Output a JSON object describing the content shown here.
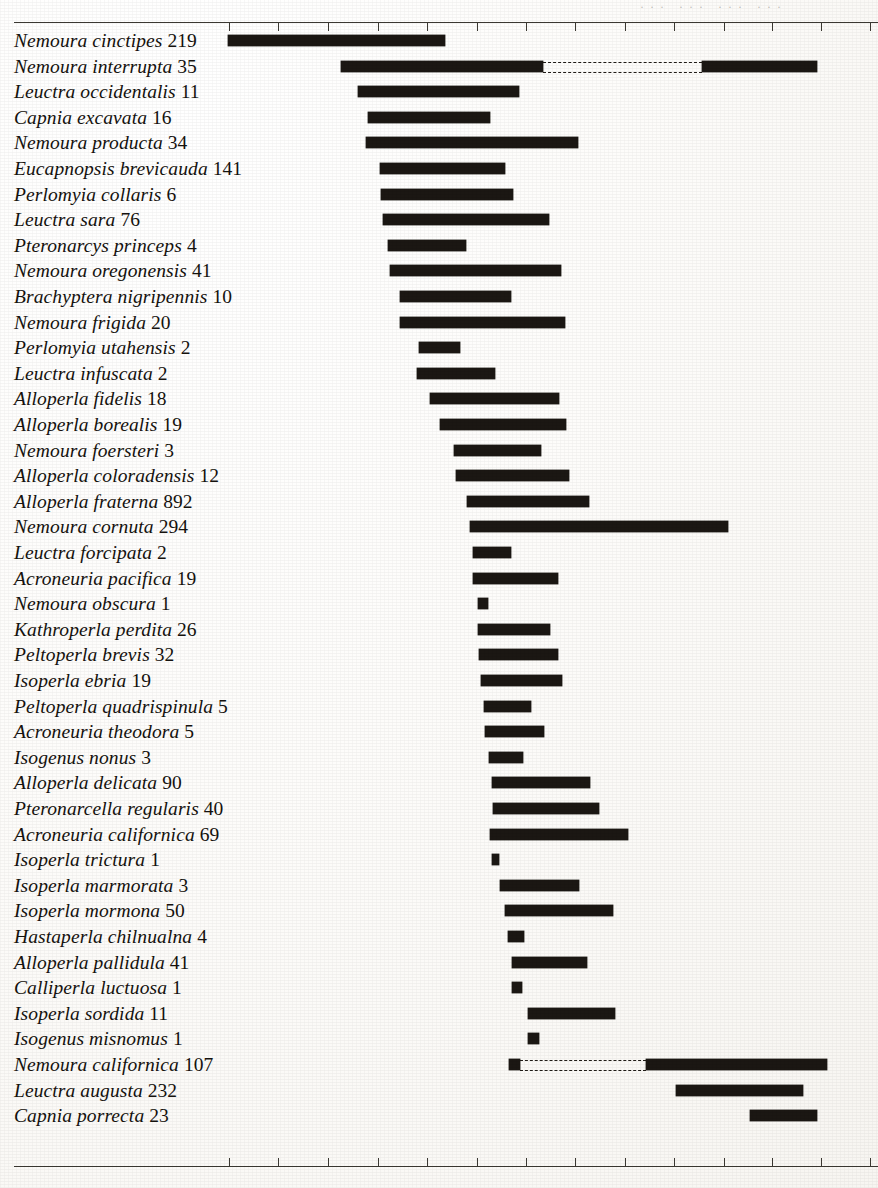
{
  "document": {
    "title": "Stonefly species seriation range chart",
    "cropped_header_text": "··· ··· ··· ···"
  },
  "axis": {
    "top_ticks_x": [
      229,
      278,
      328,
      378,
      427,
      477,
      526,
      575,
      625,
      674,
      724,
      772,
      821,
      870
    ],
    "bottom_ticks_x": [
      229,
      278,
      328,
      378,
      427,
      477,
      526,
      575,
      625,
      674,
      724,
      772,
      821,
      870
    ],
    "tick_labels": [],
    "line_color": "#3b3832"
  },
  "chart_data": {
    "type": "bar",
    "subtitle": "",
    "xlabel": "",
    "ylabel": "",
    "xlim": [
      14,
      878
    ],
    "grid": false,
    "legend": null,
    "categories": [
      "Nemoura cinctipes",
      "Nemoura interrupta",
      "Leuctra occidentalis",
      "Capnia excavata",
      "Nemoura producta",
      "Eucapnopsis brevicauda",
      "Perlomyia collaris",
      "Leuctra sara",
      "Pteronarcys princeps",
      "Nemoura oregonensis",
      "Brachyptera nigripennis",
      "Nemoura frigida",
      "Perlomyia utahensis",
      "Leuctra infuscata",
      "Alloperla fidelis",
      "Alloperla borealis",
      "Nemoura foersteri",
      "Alloperla coloradensis",
      "Alloperla fraterna",
      "Nemoura cornuta",
      "Leuctra forcipata",
      "Acroneuria pacifica",
      "Nemoura obscura",
      "Kathroperla perdita",
      "Peltoperla brevis",
      "Isoperla ebria",
      "Peltoperla quadrispinula",
      "Acroneuria theodora",
      "Isogenus nonus",
      "Alloperla delicata",
      "Pteronarcella regularis",
      "Acroneuria californica",
      "Isoperla trictura",
      "Isoperla marmorata",
      "Isoperla mormona",
      "Hastaperla chilnualna",
      "Alloperla pallidula",
      "Calliperla luctuosa",
      "Isoperla sordida",
      "Isogenus misnomus",
      "Nemoura californica",
      "Leuctra augusta",
      "Capnia porrecta"
    ],
    "values": [
      219,
      35,
      11,
      16,
      34,
      141,
      6,
      76,
      4,
      41,
      10,
      20,
      2,
      2,
      18,
      19,
      3,
      12,
      892,
      294,
      2,
      19,
      1,
      26,
      32,
      19,
      5,
      5,
      3,
      90,
      40,
      69,
      1,
      3,
      50,
      4,
      41,
      1,
      11,
      1,
      107,
      232,
      23
    ]
  },
  "rows": [
    {
      "name": "Nemoura cinctipes",
      "count": "219",
      "segments": [
        {
          "type": "solid",
          "x0": 228,
          "x1": 445
        }
      ]
    },
    {
      "name": "Nemoura interrupta",
      "count": "35",
      "segments": [
        {
          "type": "solid",
          "x0": 341,
          "x1": 543
        },
        {
          "type": "dashed",
          "x0": 543,
          "x1": 702
        },
        {
          "type": "solid",
          "x0": 702,
          "x1": 817
        }
      ]
    },
    {
      "name": "Leuctra occidentalis",
      "count": "11",
      "segments": [
        {
          "type": "solid",
          "x0": 358,
          "x1": 519
        }
      ]
    },
    {
      "name": "Capnia excavata",
      "count": "16",
      "segments": [
        {
          "type": "solid",
          "x0": 368,
          "x1": 490
        }
      ]
    },
    {
      "name": "Nemoura producta",
      "count": "34",
      "segments": [
        {
          "type": "solid",
          "x0": 366,
          "x1": 578
        }
      ]
    },
    {
      "name": "Eucapnopsis brevicauda",
      "count": "141",
      "segments": [
        {
          "type": "solid",
          "x0": 380,
          "x1": 505
        }
      ]
    },
    {
      "name": "Perlomyia collaris",
      "count": "6",
      "segments": [
        {
          "type": "solid",
          "x0": 381,
          "x1": 513
        }
      ]
    },
    {
      "name": "Leuctra sara",
      "count": "76",
      "segments": [
        {
          "type": "solid",
          "x0": 383,
          "x1": 549
        }
      ]
    },
    {
      "name": "Pteronarcys princeps",
      "count": "4",
      "segments": [
        {
          "type": "solid",
          "x0": 388,
          "x1": 466
        }
      ]
    },
    {
      "name": "Nemoura oregonensis",
      "count": "41",
      "segments": [
        {
          "type": "solid",
          "x0": 390,
          "x1": 561
        }
      ]
    },
    {
      "name": "Brachyptera nigripennis",
      "count": "10",
      "segments": [
        {
          "type": "solid",
          "x0": 400,
          "x1": 511
        }
      ]
    },
    {
      "name": "Nemoura frigida",
      "count": "20",
      "segments": [
        {
          "type": "solid",
          "x0": 400,
          "x1": 565
        }
      ]
    },
    {
      "name": "Perlomyia utahensis",
      "count": "2",
      "segments": [
        {
          "type": "solid",
          "x0": 419,
          "x1": 460
        }
      ]
    },
    {
      "name": "Leuctra infuscata",
      "count": "2",
      "segments": [
        {
          "type": "solid",
          "x0": 417,
          "x1": 495
        }
      ]
    },
    {
      "name": "Alloperla fidelis",
      "count": "18",
      "segments": [
        {
          "type": "solid",
          "x0": 430,
          "x1": 559
        }
      ]
    },
    {
      "name": "Alloperla borealis",
      "count": "19",
      "segments": [
        {
          "type": "solid",
          "x0": 440,
          "x1": 566
        }
      ]
    },
    {
      "name": "Nemoura foersteri",
      "count": "3",
      "segments": [
        {
          "type": "solid",
          "x0": 454,
          "x1": 541
        }
      ]
    },
    {
      "name": "Alloperla coloradensis",
      "count": "12",
      "segments": [
        {
          "type": "solid",
          "x0": 456,
          "x1": 569
        }
      ]
    },
    {
      "name": "Alloperla fraterna",
      "count": "892",
      "segments": [
        {
          "type": "solid",
          "x0": 467,
          "x1": 589
        }
      ]
    },
    {
      "name": "Nemoura cornuta",
      "count": "294",
      "segments": [
        {
          "type": "solid",
          "x0": 470,
          "x1": 728
        }
      ]
    },
    {
      "name": "Leuctra forcipata",
      "count": "2",
      "segments": [
        {
          "type": "solid",
          "x0": 473,
          "x1": 511
        }
      ]
    },
    {
      "name": "Acroneuria pacifica",
      "count": "19",
      "segments": [
        {
          "type": "solid",
          "x0": 473,
          "x1": 558
        }
      ]
    },
    {
      "name": "Nemoura obscura",
      "count": "1",
      "segments": [
        {
          "type": "solid",
          "x0": 478,
          "x1": 488
        }
      ]
    },
    {
      "name": "Kathroperla perdita",
      "count": "26",
      "segments": [
        {
          "type": "solid",
          "x0": 478,
          "x1": 550
        }
      ]
    },
    {
      "name": "Peltoperla brevis",
      "count": "32",
      "segments": [
        {
          "type": "solid",
          "x0": 479,
          "x1": 558
        }
      ]
    },
    {
      "name": "Isoperla ebria",
      "count": "19",
      "segments": [
        {
          "type": "solid",
          "x0": 481,
          "x1": 562
        }
      ]
    },
    {
      "name": "Peltoperla quadrispinula",
      "count": "5",
      "segments": [
        {
          "type": "solid",
          "x0": 484,
          "x1": 531
        }
      ]
    },
    {
      "name": "Acroneuria theodora",
      "count": "5",
      "segments": [
        {
          "type": "solid",
          "x0": 485,
          "x1": 544
        }
      ]
    },
    {
      "name": "Isogenus nonus",
      "count": "3",
      "segments": [
        {
          "type": "solid",
          "x0": 489,
          "x1": 523
        }
      ]
    },
    {
      "name": "Alloperla delicata",
      "count": "90",
      "segments": [
        {
          "type": "solid",
          "x0": 492,
          "x1": 590
        }
      ]
    },
    {
      "name": "Pteronarcella regularis",
      "count": "40",
      "segments": [
        {
          "type": "solid",
          "x0": 493,
          "x1": 599
        }
      ]
    },
    {
      "name": "Acroneuria californica",
      "count": "69",
      "segments": [
        {
          "type": "solid",
          "x0": 490,
          "x1": 628
        }
      ]
    },
    {
      "name": "Isoperla trictura",
      "count": "1",
      "segments": [
        {
          "type": "solid",
          "x0": 492,
          "x1": 499
        }
      ]
    },
    {
      "name": "Isoperla marmorata",
      "count": "3",
      "segments": [
        {
          "type": "solid",
          "x0": 500,
          "x1": 579
        }
      ]
    },
    {
      "name": "Isoperla mormona",
      "count": "50",
      "segments": [
        {
          "type": "solid",
          "x0": 505,
          "x1": 613
        }
      ]
    },
    {
      "name": "Hastaperla chilnualna",
      "count": "4",
      "segments": [
        {
          "type": "solid",
          "x0": 508,
          "x1": 524
        }
      ]
    },
    {
      "name": "Alloperla pallidula",
      "count": "41",
      "segments": [
        {
          "type": "solid",
          "x0": 512,
          "x1": 587
        }
      ]
    },
    {
      "name": "Calliperla luctuosa",
      "count": "1",
      "segments": [
        {
          "type": "solid",
          "x0": 512,
          "x1": 522
        }
      ]
    },
    {
      "name": "Isoperla sordida",
      "count": "11",
      "segments": [
        {
          "type": "solid",
          "x0": 528,
          "x1": 615
        }
      ]
    },
    {
      "name": "Isogenus misnomus",
      "count": "1",
      "segments": [
        {
          "type": "solid",
          "x0": 528,
          "x1": 539
        }
      ]
    },
    {
      "name": "Nemoura californica",
      "count": "107",
      "segments": [
        {
          "type": "solid",
          "x0": 509,
          "x1": 520
        },
        {
          "type": "dashed",
          "x0": 520,
          "x1": 646
        },
        {
          "type": "solid",
          "x0": 646,
          "x1": 827
        }
      ]
    },
    {
      "name": "Leuctra augusta",
      "count": "232",
      "segments": [
        {
          "type": "solid",
          "x0": 676,
          "x1": 803
        }
      ]
    },
    {
      "name": "Capnia porrecta",
      "count": "23",
      "segments": [
        {
          "type": "solid",
          "x0": 750,
          "x1": 817
        }
      ]
    }
  ],
  "layout": {
    "row_top_start": 30,
    "row_pitch": 25.6,
    "bar_color": "#1b1713",
    "text_color": "#15120e"
  }
}
